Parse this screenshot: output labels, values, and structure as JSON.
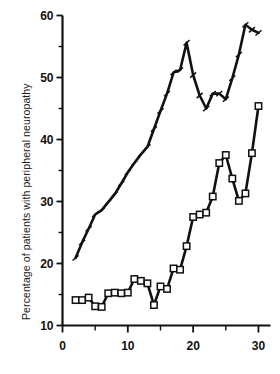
{
  "figure": {
    "width": 280,
    "height": 374,
    "background": "#ffffff",
    "ink_color": "#111111"
  },
  "axes": {
    "y_axis_title": "Percentage of patients with peripheral neuropathy",
    "x_axis_title": "",
    "x_tick_labels": [
      "0",
      "10",
      "20",
      "30"
    ],
    "y_tick_labels": [
      "10",
      "20",
      "30",
      "40",
      "50",
      "60"
    ]
  },
  "chart_data": {
    "type": "line",
    "title": "",
    "xlabel": "",
    "ylabel": "Percentage of patients with peripheral neuropathy",
    "xlim": [
      0,
      31
    ],
    "ylim": [
      10,
      60
    ],
    "xticks": [
      0,
      10,
      20,
      30
    ],
    "xticks_minor": [
      5,
      15,
      25
    ],
    "yticks": [
      10,
      20,
      30,
      40,
      50,
      60
    ],
    "yticks_minor": [
      15,
      25,
      35,
      45,
      55
    ],
    "grid": false,
    "legend": "none",
    "series": [
      {
        "name": "upper-series",
        "marker": "tick",
        "marker_fill": "#111111",
        "line_color": "#111111",
        "line_width": 2.6,
        "x": [
          2,
          3,
          4,
          5,
          6,
          7,
          8,
          9,
          10,
          11,
          12,
          13,
          14,
          15,
          16,
          17,
          18,
          19,
          20,
          21,
          22,
          23,
          24,
          25,
          26,
          27,
          28,
          29,
          30
        ],
        "y": [
          20.9,
          23.4,
          25.6,
          27.9,
          28.6,
          29.9,
          31.2,
          32.9,
          34.7,
          36.2,
          37.6,
          38.8,
          41.7,
          44.6,
          47.4,
          50.8,
          51.2,
          55.6,
          50.4,
          47.1,
          45.0,
          47.4,
          47.4,
          46.5,
          49.9,
          53.7,
          58.5,
          57.7,
          57.2
        ]
      },
      {
        "name": "lower-series",
        "marker": "open-square",
        "marker_fill": "#ffffff",
        "line_color": "#111111",
        "line_width": 2.6,
        "x": [
          2,
          3,
          4,
          5,
          6,
          7,
          8,
          9,
          10,
          11,
          12,
          13,
          14,
          15,
          16,
          17,
          18,
          19,
          20,
          21,
          22,
          23,
          24,
          25,
          26,
          27,
          28,
          29,
          30
        ],
        "y": [
          14.1,
          14.1,
          14.5,
          13.1,
          13.0,
          15.2,
          15.3,
          15.2,
          15.3,
          17.5,
          17.2,
          16.8,
          13.3,
          16.3,
          15.9,
          19.2,
          19.0,
          22.8,
          27.5,
          27.9,
          28.2,
          30.8,
          36.2,
          37.5,
          33.7,
          30.1,
          31.3,
          37.8,
          45.4
        ]
      }
    ]
  }
}
